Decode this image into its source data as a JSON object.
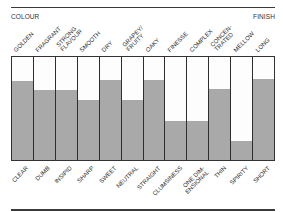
{
  "chart_data": {
    "type": "bar",
    "title": "",
    "header_left": "COLOUR",
    "header_right": "FINISH",
    "top_labels": [
      "GOLDEN",
      "FRAGRANT",
      "STRONG FLAVOUR",
      "SMOOTH",
      "DRY",
      "GRAPEY/ FRUITY",
      "OAKY",
      "FINESSE",
      "COMPLEX",
      "CONCEN- TRATED",
      "MELLOW",
      "LONG"
    ],
    "bottom_labels": [
      "CLEAR",
      "DUMB",
      "INSIPID",
      "SHARP",
      "SWEET",
      "NEUTRAL",
      "STRAIGHT",
      "CLUMSINESS",
      "ONE DIM- ENSIONAL",
      "THIN",
      "SPIRITY",
      "SHORT"
    ],
    "categories": [
      "GOLDEN/CLEAR",
      "FRAGRANT/DUMB",
      "STRONG FLAVOUR/INSIPID",
      "SMOOTH/SHARP",
      "DRY/SWEET",
      "GRAPEY FRUITY/NEUTRAL",
      "OAKY/STRAIGHT",
      "FINESSE/CLUMSINESS",
      "COMPLEX/ONE DIMENSIONAL",
      "CONCENTRATED/THIN",
      "MELLOW/SPIRITY",
      "LONG/SHORT"
    ],
    "values": [
      77,
      68,
      68,
      58,
      78,
      58,
      78,
      38,
      38,
      69,
      18,
      79
    ],
    "xlabel": "",
    "ylabel": "",
    "ylim": [
      0,
      100
    ],
    "grid": false,
    "legend": "none",
    "colors": {
      "fill": "#a9a9a9",
      "empty": "#fdfdfd",
      "border": "#2e2e2e"
    }
  },
  "labels_top_lines": [
    [
      "GOLDEN"
    ],
    [
      "FRAGRANT"
    ],
    [
      "STRONG",
      "FLAVOUR"
    ],
    [
      "SMOOTH"
    ],
    [
      "DRY"
    ],
    [
      "GRAPEY/",
      "FRUITY"
    ],
    [
      "OAKY"
    ],
    [
      "FINESSE"
    ],
    [
      "COMPLEX"
    ],
    [
      "CONCEN-",
      "TRATED"
    ],
    [
      "MELLOW"
    ],
    [
      "LONG"
    ]
  ],
  "labels_bottom_lines": [
    [
      "CLEAR"
    ],
    [
      "DUMB"
    ],
    [
      "INSIPID"
    ],
    [
      "SHARP"
    ],
    [
      "SWEET"
    ],
    [
      "NEUTRAL"
    ],
    [
      "STRAIGHT"
    ],
    [
      "CLUMSINESS"
    ],
    [
      "ONE DIM-",
      "ENSIONAL"
    ],
    [
      "THIN"
    ],
    [
      "SPIRITY"
    ],
    [
      "SHORT"
    ]
  ]
}
